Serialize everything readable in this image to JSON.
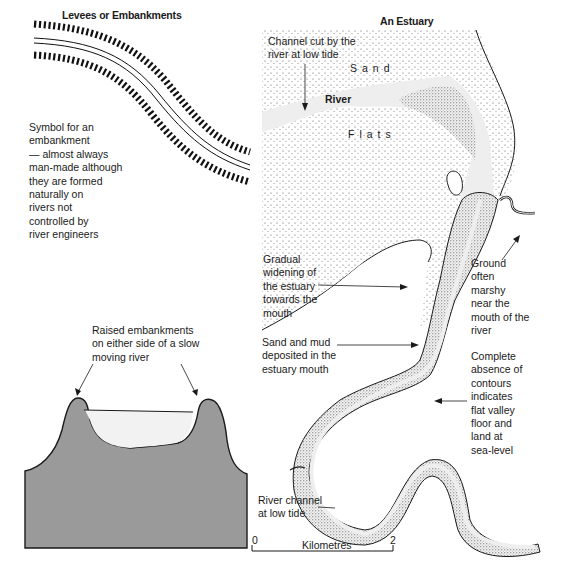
{
  "levees": {
    "title": "Levees or Embankments",
    "symbol_description": "Symbol for an\nembankment\n— almost always\nman-made although\nthey are formed\nnaturally on\nrivers not\ncontrolled by\nriver engineers",
    "cross_section_caption": "Raised embankments\non either side of a slow\nmoving river",
    "colors": {
      "ground": "#9a9a9a",
      "water": "#f2f2f2",
      "outline": "#1a1a1a"
    }
  },
  "estuary": {
    "title": "An Estuary",
    "map_labels": {
      "sand": "Sand",
      "river": "River",
      "flats": "Flats"
    },
    "annotations": [
      {
        "id": "channel-cut",
        "text": "Channel cut by the\nriver at low tide"
      },
      {
        "id": "gradual-widening",
        "text": "Gradual\nwidening of\nthe estuary\ntowards the\nmouth"
      },
      {
        "id": "sand-mud",
        "text": "Sand and mud\ndeposited in the\nestuary mouth"
      },
      {
        "id": "marshy-ground",
        "text": "Ground\noften\nmarshy\nnear the\nmouth of the\nriver"
      },
      {
        "id": "no-contours",
        "text": "Complete\nabsence of\ncontours\nindicates\nflat valley\nfloor and\nland at\nsea-level"
      },
      {
        "id": "low-tide-channel",
        "text": "River channel\nat low tide"
      }
    ],
    "scale_bar": {
      "start": "0",
      "end": "2",
      "unit": "Kilometres"
    }
  }
}
